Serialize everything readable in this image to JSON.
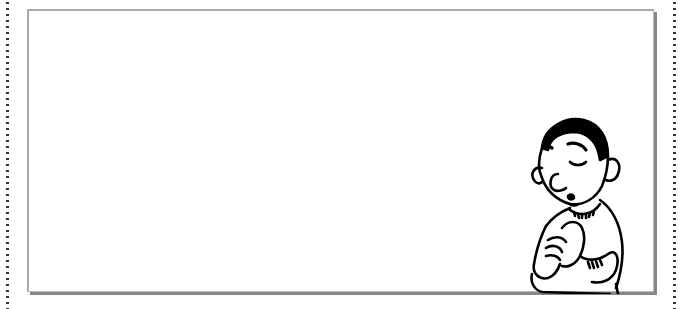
{
  "frame": {
    "border_style": "dotted",
    "dot_color": "#333333",
    "card_border_color": "#a9a9a9",
    "card_shadow_color": "#888888"
  },
  "card": {
    "content": "",
    "illustration": "praying-boy"
  }
}
